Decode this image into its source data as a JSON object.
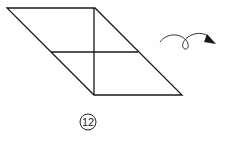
{
  "diagram": {
    "type": "origami-fold-step",
    "step_number": "12",
    "shape": "parallelogram",
    "fold_lines": [
      "vertical-center",
      "horizontal-center"
    ],
    "action_icon": "turn-over-arrow",
    "colors": {
      "line": "#1a1a1a",
      "background": "#ffffff"
    }
  }
}
